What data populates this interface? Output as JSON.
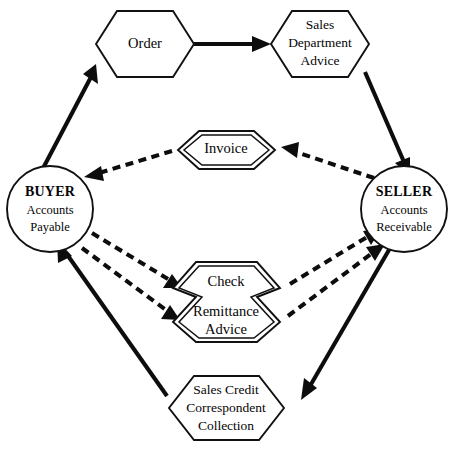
{
  "diagram": {
    "background_color": "#ffffff",
    "line_color": "#0d0d0d",
    "text_color": "#050505"
  },
  "nodes": {
    "order": {
      "label": "Order",
      "shape": "hexagon",
      "outline": "single"
    },
    "sales_department_advice": {
      "line1": "Sales",
      "line2": "Department",
      "line3": "Advice",
      "shape": "hexagon",
      "outline": "single"
    },
    "invoice": {
      "label": "Invoice",
      "shape": "hexagon",
      "outline": "double"
    },
    "check_remittance": {
      "line1": "Check",
      "line2": "Remittance",
      "line3": "Advice",
      "shape": "double-hexagon",
      "outline": "double"
    },
    "sales_credit": {
      "line1": "Sales Credit",
      "line2": "Correspondent",
      "line3": "Collection",
      "shape": "hexagon",
      "outline": "single"
    },
    "buyer": {
      "line1": "BUYER",
      "line2": "Accounts",
      "line3": "Payable",
      "shape": "circle"
    },
    "seller": {
      "line1": "SELLER",
      "line2": "Accounts",
      "line3": "Receivable",
      "shape": "circle"
    }
  },
  "edges": [
    {
      "id": "buyer-to-order",
      "from": "buyer",
      "to": "order",
      "style": "solid"
    },
    {
      "id": "order-to-sales-advice",
      "from": "order",
      "to": "sales_department_advice",
      "style": "solid"
    },
    {
      "id": "sales-advice-to-seller",
      "from": "sales_department_advice",
      "to": "seller",
      "style": "solid"
    },
    {
      "id": "seller-to-invoice",
      "from": "seller",
      "to": "invoice",
      "style": "dashed"
    },
    {
      "id": "invoice-to-buyer",
      "from": "invoice",
      "to": "buyer",
      "style": "dashed"
    },
    {
      "id": "buyer-to-check",
      "from": "buyer",
      "to": "check_remittance",
      "style": "dashed"
    },
    {
      "id": "buyer-to-remittance",
      "from": "buyer",
      "to": "check_remittance",
      "style": "dashed"
    },
    {
      "id": "check-to-seller",
      "from": "check_remittance",
      "to": "seller",
      "style": "dashed"
    },
    {
      "id": "remittance-to-seller",
      "from": "check_remittance",
      "to": "seller",
      "style": "dashed"
    },
    {
      "id": "seller-to-sales-credit",
      "from": "seller",
      "to": "sales_credit",
      "style": "solid"
    },
    {
      "id": "sales-credit-to-buyer",
      "from": "sales_credit",
      "to": "buyer",
      "style": "solid"
    }
  ],
  "footer": {
    "caption_artifact": ""
  }
}
